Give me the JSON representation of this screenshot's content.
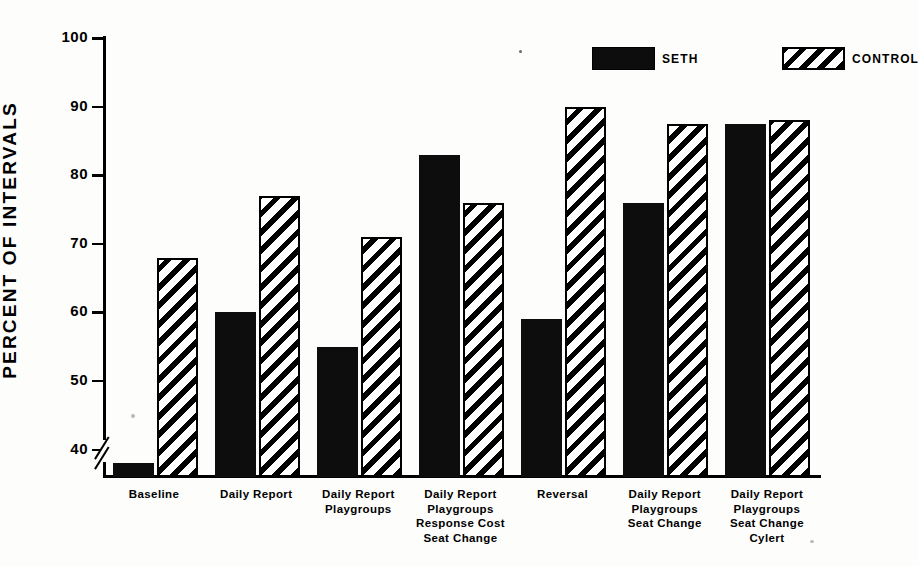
{
  "chart_data": {
    "type": "bar",
    "title": "",
    "xlabel": "",
    "ylabel": "PERCENT OF INTERVALS",
    "ylim": [
      36,
      100
    ],
    "yticks": [
      40,
      50,
      60,
      70,
      80,
      90,
      100
    ],
    "axis_break": true,
    "grid": false,
    "legend_position": "top-right",
    "categories": [
      "Baseline",
      "Daily Report",
      "Daily Report\nPlaygroups",
      "Daily Report\nPlaygroups\nResponse Cost\nSeat Change",
      "Reversal",
      "Daily Report\nPlaygroups\nSeat Change",
      "Daily Report\nPlaygroups\nSeat Change\nCylert"
    ],
    "series": [
      {
        "name": "SETH",
        "values": [
          38,
          60,
          55,
          83,
          59,
          76,
          87.5
        ],
        "color": "#0d0d0d",
        "fill": "solid"
      },
      {
        "name": "CONTROL",
        "values": [
          68,
          77,
          71,
          76,
          90,
          87.5,
          88
        ],
        "color": "#000000",
        "fill": "diagonal-hatch"
      }
    ]
  },
  "axis": {
    "tick_labels": [
      "100",
      "90",
      "80",
      "70",
      "60",
      "50",
      "40"
    ],
    "y_title": "PERCENT OF INTERVALS"
  },
  "legend": {
    "entries": [
      {
        "label": "SETH"
      },
      {
        "label": "CONTROL"
      }
    ]
  }
}
